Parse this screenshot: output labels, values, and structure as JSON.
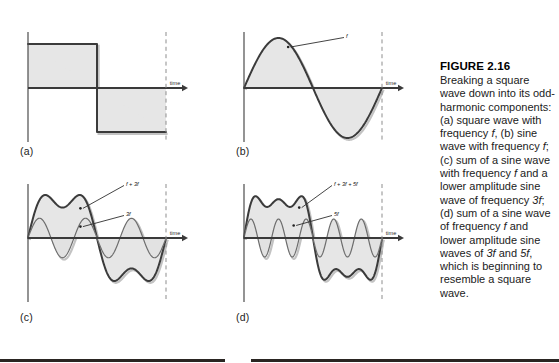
{
  "figure": {
    "caption_title": "FIGURE 2.16",
    "caption_body": "Breaking a square wave down into its odd-harmonic components: (a) square wave with frequency f, (b) sine wave with frequency f; (c) sum of a sine wave with frequency f and a lower amplitude sine wave of frequency 3f; (d) sum of a sine wave of frequency f and lower amplitude sine waves of 3f and 5f, which is beginning to resemble a square wave.",
    "axis_label_time": "time"
  },
  "panels": [
    {
      "id": "a",
      "panel_label": "(a)",
      "axis_label": "time",
      "series_labels": [],
      "description": "square wave with frequency f"
    },
    {
      "id": "b",
      "panel_label": "(b)",
      "axis_label": "time",
      "series_labels": [
        "f"
      ],
      "description": "sine wave with frequency f"
    },
    {
      "id": "c",
      "panel_label": "(c)",
      "axis_label": "time",
      "series_labels": [
        "f + 3f",
        "3f"
      ],
      "description": "sum of sine wave f and lower amplitude sine wave 3f"
    },
    {
      "id": "d",
      "panel_label": "(d)",
      "axis_label": "time",
      "series_labels": [
        "f + 3f + 5f",
        "5f"
      ],
      "description": "sum of sine wave f and lower amplitude sine waves 3f and 5f"
    }
  ],
  "chart_data": [
    {
      "type": "line",
      "id": "a",
      "title": "(a) square wave with frequency f",
      "xlabel": "time",
      "ylabel": "",
      "xlim": [
        0,
        1
      ],
      "ylim": [
        -1.15,
        1.15
      ],
      "grid": false,
      "legend": "none",
      "series": [
        {
          "name": "square wave f",
          "waveform": "square",
          "harmonics": [
            {
              "n": 1,
              "amplitude": 1
            }
          ],
          "periods": 1,
          "amplitude": 1,
          "filled": true
        }
      ]
    },
    {
      "type": "line",
      "id": "b",
      "title": "(b) sine wave with frequency f",
      "xlabel": "time",
      "ylabel": "",
      "xlim": [
        0,
        1
      ],
      "ylim": [
        -1.15,
        1.15
      ],
      "grid": false,
      "legend": "annotation",
      "annotations": [
        {
          "text": "f",
          "target_x": 0.32,
          "target_y": 0.82
        }
      ],
      "series": [
        {
          "name": "f",
          "waveform": "sine",
          "harmonics": [
            {
              "n": 1,
              "amplitude": 1
            }
          ],
          "periods": 1,
          "amplitude": 1,
          "filled": true
        }
      ]
    },
    {
      "type": "line",
      "id": "c",
      "title": "(c) sum of sine wave f and lower amplitude sine wave 3f",
      "xlabel": "time",
      "ylabel": "",
      "xlim": [
        0,
        1
      ],
      "ylim": [
        -1.35,
        1.35
      ],
      "grid": false,
      "legend": "annotation",
      "annotations": [
        {
          "text": "f + 3f",
          "target_x": 0.38,
          "target_y": 0.78
        },
        {
          "text": "3f",
          "target_x": 0.38,
          "target_y": 0.3
        }
      ],
      "series": [
        {
          "name": "f + 3f",
          "waveform": "sum",
          "harmonics": [
            {
              "n": 1,
              "amplitude": 1
            },
            {
              "n": 3,
              "amplitude": 0.3333
            }
          ],
          "periods": 1,
          "amplitude": 1.2,
          "filled": false
        },
        {
          "name": "3f",
          "waveform": "sine",
          "harmonics": [
            {
              "n": 3,
              "amplitude": 1
            }
          ],
          "periods": 1,
          "amplitude": 0.52,
          "filled": true
        }
      ]
    },
    {
      "type": "line",
      "id": "d",
      "title": "(d) sum of sine wave f and lower amplitude sine waves 3f and 5f",
      "xlabel": "time",
      "ylabel": "",
      "xlim": [
        0,
        1
      ],
      "ylim": [
        -1.35,
        1.35
      ],
      "grid": false,
      "legend": "annotation",
      "annotations": [
        {
          "text": "f + 3f + 5f",
          "target_x": 0.4,
          "target_y": 0.8
        },
        {
          "text": "5f",
          "target_x": 0.36,
          "target_y": 0.33
        }
      ],
      "series": [
        {
          "name": "f + 3f + 5f",
          "waveform": "sum",
          "harmonics": [
            {
              "n": 1,
              "amplitude": 1
            },
            {
              "n": 3,
              "amplitude": 0.3333
            },
            {
              "n": 5,
              "amplitude": 0.2
            }
          ],
          "periods": 1,
          "amplitude": 1.18,
          "filled": false
        },
        {
          "name": "5f",
          "waveform": "sine",
          "harmonics": [
            {
              "n": 5,
              "amplitude": 1
            }
          ],
          "periods": 1,
          "amplitude": 0.5,
          "filled": true
        }
      ]
    }
  ],
  "colors": {
    "wave_fill": "#e6e6e6",
    "wave_stroke": "#3b3b3b",
    "harmonic_fill": "#e2e2e2",
    "harmonic_stroke": "#6d6d6d",
    "axis": "#3a3a3a",
    "dashed_guide": "#8d8d8d",
    "text": "#1b1b1b",
    "page_rule": "#2a2522"
  }
}
